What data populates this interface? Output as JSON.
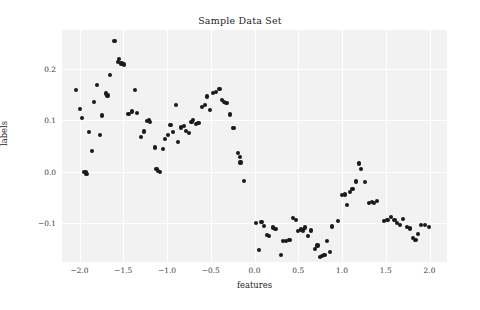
{
  "chart_data": {
    "type": "scatter",
    "title": "Sample Data Set",
    "xlabel": "features",
    "ylabel": "labels",
    "xlim": [
      -2.2,
      2.2
    ],
    "ylim": [
      -0.175,
      0.275
    ],
    "grid": true,
    "legend": null,
    "xticks": [
      "-2.0",
      "-1.5",
      "-1.0",
      "-0.5",
      "0.0",
      "0.5",
      "1.0",
      "1.5",
      "2.0"
    ],
    "xtick_values": [
      -2.0,
      -1.5,
      -1.0,
      -0.5,
      0.0,
      0.5,
      1.0,
      1.5,
      2.0
    ],
    "yticks": [
      "0.2",
      "0.1",
      "0.0",
      "-0.1"
    ],
    "ytick_values": [
      0.2,
      0.1,
      0.0,
      -0.1
    ],
    "marker": "circle",
    "marker_color": "#1a1a1a",
    "plot_background": "#f2f2f2",
    "grid_color": "#ffffff",
    "series": [
      {
        "name": "samples",
        "points": [
          [
            -2.04,
            0.158
          ],
          [
            -1.99,
            0.122
          ],
          [
            -1.97,
            0.104
          ],
          [
            -1.95,
            0.0
          ],
          [
            -1.93,
            0.0
          ],
          [
            -1.92,
            -0.004
          ],
          [
            -1.89,
            0.077
          ],
          [
            -1.86,
            0.041
          ],
          [
            -1.83,
            0.135
          ],
          [
            -1.8,
            0.168
          ],
          [
            -1.77,
            0.071
          ],
          [
            -1.74,
            0.109
          ],
          [
            -1.7,
            0.152
          ],
          [
            -1.68,
            0.148
          ],
          [
            -1.65,
            0.188
          ],
          [
            -1.6,
            0.253
          ],
          [
            -1.56,
            0.213
          ],
          [
            -1.55,
            0.219
          ],
          [
            -1.52,
            0.21
          ],
          [
            -1.49,
            0.208
          ],
          [
            -1.44,
            0.112
          ],
          [
            -1.4,
            0.117
          ],
          [
            -1.37,
            0.158
          ],
          [
            -1.34,
            0.114
          ],
          [
            -1.3,
            0.068
          ],
          [
            -1.26,
            0.078
          ],
          [
            -1.23,
            0.099
          ],
          [
            -1.21,
            0.101
          ],
          [
            -1.19,
            0.097
          ],
          [
            -1.14,
            0.047
          ],
          [
            -1.12,
            0.006
          ],
          [
            -1.1,
            0.002
          ],
          [
            -1.08,
            0.0
          ],
          [
            -1.05,
            0.044
          ],
          [
            -1.02,
            0.063
          ],
          [
            -0.99,
            0.072
          ],
          [
            -0.96,
            0.091
          ],
          [
            -0.93,
            0.077
          ],
          [
            -0.9,
            0.13
          ],
          [
            -0.87,
            0.057
          ],
          [
            -0.84,
            0.086
          ],
          [
            -0.81,
            0.089
          ],
          [
            -0.78,
            0.079
          ],
          [
            -0.75,
            0.076
          ],
          [
            -0.72,
            0.096
          ],
          [
            -0.7,
            0.101
          ],
          [
            -0.67,
            0.093
          ],
          [
            -0.64,
            0.095
          ],
          [
            -0.6,
            0.126
          ],
          [
            -0.57,
            0.13
          ],
          [
            -0.54,
            0.146
          ],
          [
            -0.51,
            0.12
          ],
          [
            -0.47,
            0.153
          ],
          [
            -0.44,
            0.155
          ],
          [
            -0.4,
            0.16
          ],
          [
            -0.37,
            0.14
          ],
          [
            -0.35,
            0.136
          ],
          [
            -0.32,
            0.133
          ],
          [
            -0.28,
            0.111
          ],
          [
            -0.24,
            0.085
          ],
          [
            -0.19,
            0.036
          ],
          [
            -0.17,
            0.028
          ],
          [
            -0.16,
            0.018
          ],
          [
            -0.12,
            -0.018
          ],
          [
            0.02,
            -0.1
          ],
          [
            0.05,
            -0.152
          ],
          [
            0.08,
            -0.097
          ],
          [
            0.11,
            -0.105
          ],
          [
            0.14,
            -0.122
          ],
          [
            0.17,
            -0.124
          ],
          [
            0.21,
            -0.108
          ],
          [
            0.24,
            -0.111
          ],
          [
            0.3,
            -0.161
          ],
          [
            0.33,
            -0.134
          ],
          [
            0.36,
            -0.134
          ],
          [
            0.4,
            -0.133
          ],
          [
            0.44,
            -0.089
          ],
          [
            0.47,
            -0.093
          ],
          [
            0.5,
            -0.115
          ],
          [
            0.53,
            -0.112
          ],
          [
            0.55,
            -0.114
          ],
          [
            0.58,
            -0.108
          ],
          [
            0.61,
            -0.125
          ],
          [
            0.65,
            -0.114
          ],
          [
            0.69,
            -0.15
          ],
          [
            0.72,
            -0.143
          ],
          [
            0.75,
            -0.165
          ],
          [
            0.77,
            -0.164
          ],
          [
            0.8,
            -0.161
          ],
          [
            0.83,
            -0.134
          ],
          [
            0.86,
            -0.155
          ],
          [
            0.89,
            -0.106
          ],
          [
            0.95,
            -0.095
          ],
          [
            1.0,
            -0.045
          ],
          [
            1.03,
            -0.044
          ],
          [
            1.06,
            -0.064
          ],
          [
            1.09,
            -0.039
          ],
          [
            1.12,
            -0.033
          ],
          [
            1.16,
            -0.019
          ],
          [
            1.19,
            0.016
          ],
          [
            1.22,
            0.005
          ],
          [
            1.26,
            -0.02
          ],
          [
            1.31,
            -0.061
          ],
          [
            1.34,
            -0.059
          ],
          [
            1.37,
            -0.06
          ],
          [
            1.4,
            -0.057
          ],
          [
            1.48,
            -0.095
          ],
          [
            1.52,
            -0.094
          ],
          [
            1.56,
            -0.087
          ],
          [
            1.6,
            -0.093
          ],
          [
            1.63,
            -0.099
          ],
          [
            1.66,
            -0.103
          ],
          [
            1.7,
            -0.091
          ],
          [
            1.74,
            -0.107
          ],
          [
            1.78,
            -0.11
          ],
          [
            1.81,
            -0.129
          ],
          [
            1.84,
            -0.133
          ],
          [
            1.87,
            -0.121
          ],
          [
            1.9,
            -0.104
          ],
          [
            1.95,
            -0.104
          ],
          [
            1.99,
            -0.107
          ]
        ]
      }
    ]
  }
}
